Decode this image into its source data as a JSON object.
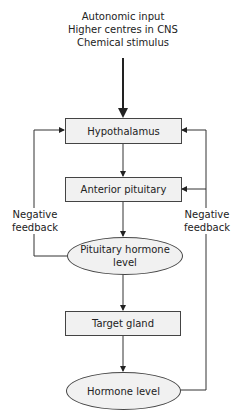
{
  "inputs": {
    "line1": "Autonomic input",
    "line2": "Higher centres in CNS",
    "line3": "Chemical stimulus"
  },
  "nodes": {
    "hypothalamus": "Hypothalamus",
    "anterior_pituitary": "Anterior pituitary",
    "pituitary_hormone_level_line1": "Pituitary hormone",
    "pituitary_hormone_level_line2": "level",
    "target_gland": "Target gland",
    "hormone_level": "Hormone level"
  },
  "feedback": {
    "left_line1": "Negative",
    "left_line2": "feedback",
    "right_line1": "Negative",
    "right_line2": "feedback"
  }
}
